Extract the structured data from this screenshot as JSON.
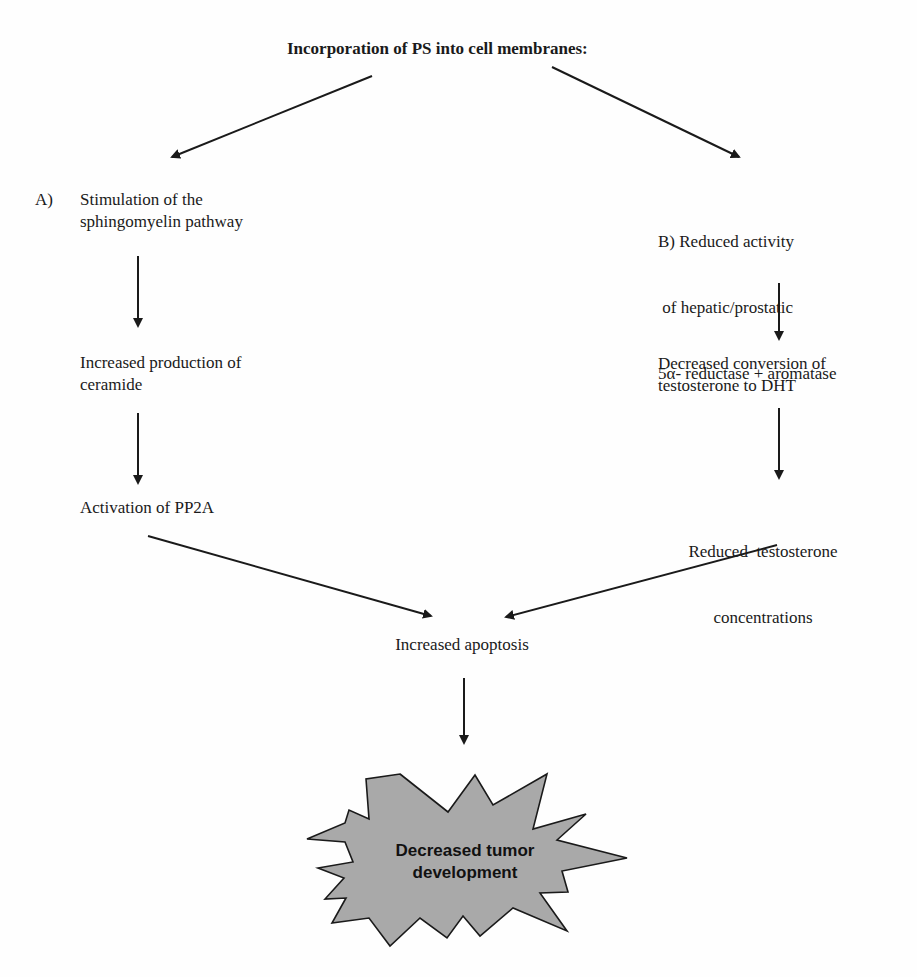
{
  "diagram": {
    "title": "Incorporation of PS into cell membranes:",
    "branch_a": {
      "label_prefix": "A)",
      "step1": [
        "Stimulation of the",
        "sphingomyelin pathway"
      ],
      "step2": [
        "Increased production of",
        "ceramide"
      ],
      "step3": [
        "Activation of PP2A"
      ]
    },
    "branch_b": {
      "step1": [
        "B) Reduced activity",
        " of hepatic/prostatic",
        "5α- reductase + aromatase"
      ],
      "step2": [
        "Decreased conversion of",
        "testosterone to DHT"
      ],
      "step3": [
        "Reduced  testosterone",
        "concentrations"
      ]
    },
    "merge": "Increased apoptosis",
    "outcome": [
      "Decreased tumor",
      "development"
    ],
    "colors": {
      "line": "#1a1a1a",
      "burst_fill": "#a9a9a9",
      "burst_stroke": "#1a1a1a"
    }
  }
}
